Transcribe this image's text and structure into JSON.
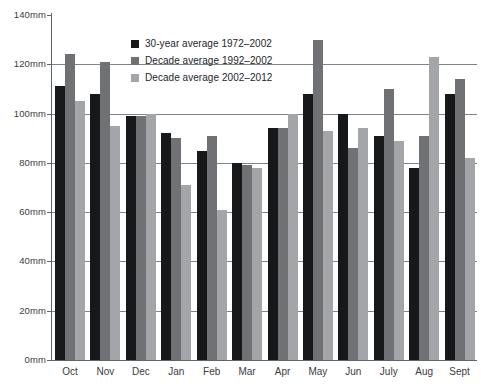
{
  "chart_data": {
    "type": "bar",
    "title": "",
    "xlabel": "",
    "ylabel": "",
    "ylim": [
      0,
      140
    ],
    "yunit": "mm",
    "ytick_labels": [
      "140mm",
      "120mm",
      "100mm",
      "80mm",
      "60mm",
      "40mm",
      "20mm",
      "0mm"
    ],
    "ytick_values": [
      140,
      120,
      100,
      80,
      60,
      40,
      20,
      0
    ],
    "grid": "horizontal",
    "legend_position": "top-center",
    "categories": [
      "Oct",
      "Nov",
      "Dec",
      "Jan",
      "Feb",
      "Mar",
      "Apr",
      "May",
      "Jun",
      "July",
      "Aug",
      "Sept"
    ],
    "series": [
      {
        "name": "30-year average 1972-2002",
        "color": "#17181a",
        "values": [
          111,
          108,
          99,
          92,
          85,
          80,
          94,
          108,
          100,
          91,
          78,
          108
        ]
      },
      {
        "name": "Decade average 1992-2002",
        "color": "#6f7175",
        "values": [
          124,
          121,
          99,
          90,
          91,
          79,
          94,
          130,
          86,
          110,
          91,
          114
        ]
      },
      {
        "name": "Decade average 2002-2012",
        "color": "#a3a5a8",
        "values": [
          105,
          95,
          100,
          71,
          61,
          78,
          100,
          93,
          94,
          89,
          123,
          82
        ]
      }
    ]
  },
  "legend": {
    "items": [
      {
        "label": "30-year average  1972–2002",
        "color": "#17181a"
      },
      {
        "label": "Decade average 1992–2002",
        "color": "#6f7175"
      },
      {
        "label": "Decade average 2002–2012",
        "color": "#a3a5a8"
      }
    ]
  },
  "axis_colors": {
    "axis": "#5b6670",
    "gridline": "#7a858e",
    "tick_text": "#3c3c3c"
  }
}
